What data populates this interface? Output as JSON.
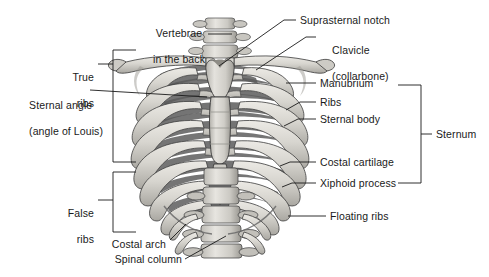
{
  "figure": {
    "type": "anatomical-diagram",
    "background_color": "#ffffff",
    "text_color": "#1a1a1a",
    "bone_light": "#dcdad4",
    "bone_mid": "#b6b4ae",
    "bone_shadow": "#6f6f6f",
    "bone_dark": "#4a4a4a",
    "outline": "#2b2b2b"
  },
  "labels": {
    "vertebrae_in_the_back": "Vertebrae\nin the back",
    "vertebrae_line1": "Vertebrae",
    "vertebrae_line2": "in the back",
    "suprasternal_notch": "Suprasternal notch",
    "clavicle_line1": "Clavicle",
    "clavicle_line2": "(collarbone)",
    "true_ribs_line1": "True",
    "true_ribs_line2": "ribs",
    "sternal_angle_line1": "Sternal angle",
    "sternal_angle_line2": "(angle of Louis)",
    "manubrium": "Manubrium",
    "ribs": "Ribs",
    "sternal_body": "Sternal body",
    "sternum": "Sternum",
    "costal_cartilage": "Costal cartilage",
    "xiphoid_process": "Xiphoid process",
    "false_ribs_line1": "False",
    "false_ribs_line2": "ribs",
    "floating_ribs": "Floating ribs",
    "costal_arch": "Costal arch",
    "spinal_column": "Spinal column"
  },
  "brackets": {
    "true_ribs": {
      "label": "True ribs",
      "orientation": "left"
    },
    "false_ribs": {
      "label": "False ribs",
      "orientation": "left"
    },
    "sternum": {
      "label": "Sternum",
      "orientation": "right"
    }
  }
}
